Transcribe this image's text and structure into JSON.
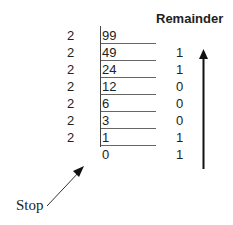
{
  "header": {
    "remainder_label": "Remainder"
  },
  "divisor": "2",
  "rows": [
    {
      "divisor": "2",
      "quotient": "99",
      "remainder": ""
    },
    {
      "divisor": "2",
      "quotient": "49",
      "remainder": "1"
    },
    {
      "divisor": "2",
      "quotient": "24",
      "remainder": "1"
    },
    {
      "divisor": "2",
      "quotient": "12",
      "remainder": "0"
    },
    {
      "divisor": "2",
      "quotient": "6",
      "remainder": "0"
    },
    {
      "divisor": "2",
      "quotient": "3",
      "remainder": "0"
    },
    {
      "divisor": "2",
      "quotient": "1",
      "remainder": "1"
    },
    {
      "divisor": "",
      "quotient": "0",
      "remainder": "1"
    }
  ],
  "annotations": {
    "stop_label": "Stop",
    "read_direction": "up-arrow"
  },
  "colors": {
    "text": "#222222",
    "lines": "#666666",
    "arrow": "#111111"
  }
}
